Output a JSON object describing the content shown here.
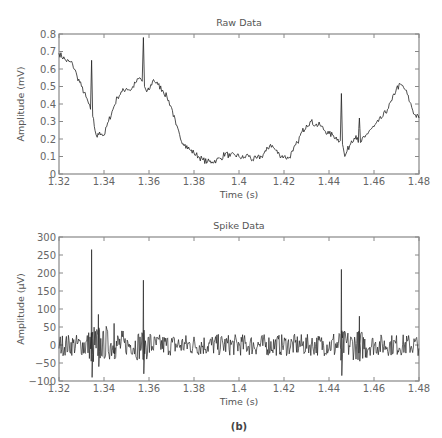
{
  "caption": "(b)",
  "chart_data": [
    {
      "type": "line",
      "title": "Raw Data",
      "xlabel": "Time (s)",
      "ylabel": "Amplitude (mV)",
      "xlim": [
        1.32,
        1.48
      ],
      "ylim": [
        0,
        0.8
      ],
      "xticks": [
        "1.32",
        "1.34",
        "1.36",
        "1.38",
        "1.4",
        "1.42",
        "1.44",
        "1.46",
        "1.48"
      ],
      "yticks": [
        "0",
        "0.1",
        "0.2",
        "0.3",
        "0.4",
        "0.5",
        "0.6",
        "0.7",
        "0.8"
      ],
      "grid": false,
      "x": [
        1.32,
        1.323,
        1.326,
        1.328,
        1.33,
        1.332,
        1.334,
        1.3345,
        1.335,
        1.336,
        1.337,
        1.338,
        1.339,
        1.34,
        1.342,
        1.344,
        1.346,
        1.348,
        1.35,
        1.352,
        1.354,
        1.356,
        1.357,
        1.3575,
        1.358,
        1.359,
        1.36,
        1.362,
        1.364,
        1.366,
        1.368,
        1.37,
        1.372,
        1.374,
        1.376,
        1.378,
        1.38,
        1.382,
        1.384,
        1.386,
        1.388,
        1.39,
        1.392,
        1.394,
        1.396,
        1.398,
        1.4,
        1.402,
        1.404,
        1.406,
        1.408,
        1.41,
        1.412,
        1.414,
        1.416,
        1.418,
        1.42,
        1.422,
        1.424,
        1.426,
        1.428,
        1.43,
        1.432,
        1.434,
        1.436,
        1.438,
        1.44,
        1.442,
        1.444,
        1.445,
        1.4455,
        1.446,
        1.447,
        1.448,
        1.45,
        1.452,
        1.453,
        1.4535,
        1.454,
        1.456,
        1.458,
        1.46,
        1.462,
        1.464,
        1.466,
        1.468,
        1.47,
        1.472,
        1.474,
        1.476,
        1.478,
        1.48
      ],
      "values": [
        0.69,
        0.65,
        0.63,
        0.56,
        0.5,
        0.44,
        0.37,
        0.65,
        0.33,
        0.25,
        0.21,
        0.24,
        0.23,
        0.22,
        0.3,
        0.37,
        0.44,
        0.47,
        0.49,
        0.48,
        0.52,
        0.55,
        0.53,
        0.78,
        0.5,
        0.47,
        0.48,
        0.54,
        0.51,
        0.48,
        0.44,
        0.38,
        0.28,
        0.2,
        0.17,
        0.14,
        0.12,
        0.1,
        0.08,
        0.07,
        0.07,
        0.08,
        0.09,
        0.12,
        0.1,
        0.11,
        0.1,
        0.09,
        0.11,
        0.08,
        0.09,
        0.1,
        0.13,
        0.17,
        0.14,
        0.11,
        0.1,
        0.09,
        0.13,
        0.18,
        0.24,
        0.28,
        0.3,
        0.28,
        0.28,
        0.25,
        0.23,
        0.22,
        0.2,
        0.19,
        0.46,
        0.17,
        0.1,
        0.13,
        0.19,
        0.22,
        0.18,
        0.32,
        0.18,
        0.21,
        0.25,
        0.27,
        0.3,
        0.33,
        0.37,
        0.42,
        0.49,
        0.51,
        0.48,
        0.41,
        0.34,
        0.32
      ]
    },
    {
      "type": "line",
      "title": "Spike Data",
      "xlabel": "Time (s)",
      "ylabel": "Amplitude (μV)",
      "xlim": [
        1.32,
        1.48
      ],
      "ylim": [
        -100,
        300
      ],
      "xticks": [
        "1.32",
        "1.34",
        "1.36",
        "1.38",
        "1.4",
        "1.42",
        "1.44",
        "1.46",
        "1.48"
      ],
      "yticks": [
        "−100",
        "−50",
        "0",
        "50",
        "100",
        "150",
        "200",
        "250",
        "300"
      ],
      "grid": false,
      "spikes": [
        {
          "t": 1.3345,
          "peak": 265,
          "trough": -90
        },
        {
          "t": 1.3375,
          "peak": 85,
          "trough": -60
        },
        {
          "t": 1.3445,
          "peak": 60,
          "trough": -25
        },
        {
          "t": 1.3575,
          "peak": 180,
          "trough": -80
        },
        {
          "t": 1.4455,
          "peak": 210,
          "trough": -85
        },
        {
          "t": 1.4535,
          "peak": 80,
          "trough": -45
        }
      ],
      "noise_amplitude_uV": 30
    }
  ]
}
